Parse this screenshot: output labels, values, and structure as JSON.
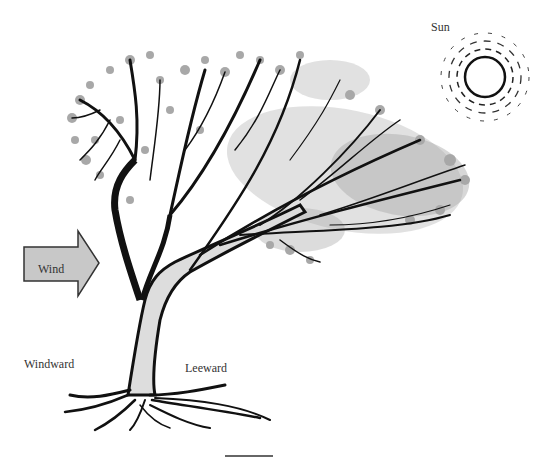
{
  "figure": {
    "labels": {
      "sun": "Sun",
      "wind": "Wind",
      "windward": "Windward",
      "leeward": "Leeward"
    },
    "elements": {
      "sun_icon": "sun-with-dashed-rays",
      "wind_arrow": "right-pointing-arrow",
      "tree": "wind-swept-tree-leaning-leeward",
      "scale_bar": "horizontal-line"
    },
    "colors": {
      "ink": "#1a1a1a",
      "foliage": "#9a9a9a",
      "arrow_fill": "#c8c8c8",
      "background": "#ffffff"
    }
  }
}
